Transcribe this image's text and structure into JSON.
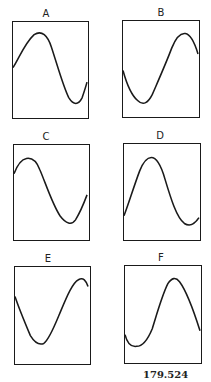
{
  "figure": {
    "caption": "179.524",
    "panels": [
      {
        "label": "A",
        "box": [
          12,
          21,
          77,
          98
        ],
        "label_pos": [
          46,
          9
        ],
        "wave": {
          "start": "mid-rising",
          "path": "M0,47 C6,38 12,22 22,13 C30,8 36,14 40,26 C46,44 52,66 58,78 C63,86 68,86 72,78 C74,72 76,66 77,62"
        }
      },
      {
        "label": "B",
        "box": [
          122,
          20,
          78,
          98
        ],
        "label_pos": [
          161,
          8
        ],
        "wave": {
          "start": "mid-falling",
          "path": "M0,51 C3,62 8,76 15,82 C21,88 26,84 30,76 C36,62 44,44 50,28 C54,18 58,12 64,13 C70,14 74,24 77,34"
        }
      },
      {
        "label": "C",
        "box": [
          13,
          144,
          77,
          97
        ],
        "label_pos": [
          46,
          132
        ],
        "wave": {
          "start": "mid-rising",
          "path": "M0,30 C3,22 7,15 13,14 C19,13 24,18 27,26 C33,40 40,62 48,74 C54,82 60,84 64,78 C69,70 73,60 76,52"
        }
      },
      {
        "label": "D",
        "box": [
          123,
          143,
          78,
          98
        ],
        "label_pos": [
          160,
          131
        ],
        "wave": {
          "start": "low-rising",
          "path": "M0,74 C4,64 10,44 16,28 C20,18 24,14 28,14 C33,14 38,22 42,36 C48,56 54,76 62,82 C68,86 73,82 77,76"
        }
      },
      {
        "label": "E",
        "box": [
          14,
          266,
          77,
          99
        ],
        "label_pos": [
          48,
          254
        ],
        "wave": {
          "start": "high-falling",
          "path": "M0,30 C4,42 10,56 16,70 C21,78 25,80 30,78 C36,74 42,58 48,44 C54,30 60,16 66,13 C71,10 74,14 76,20"
        }
      },
      {
        "label": "F",
        "box": [
          124,
          265,
          78,
          99
        ],
        "label_pos": [
          161,
          253
        ],
        "wave": {
          "start": "low-dip",
          "path": "M0,70 C2,78 6,83 12,82 C18,82 23,76 28,64 C33,48 38,30 44,18 C48,12 52,11 56,16 C62,24 70,44 77,66"
        }
      }
    ]
  }
}
